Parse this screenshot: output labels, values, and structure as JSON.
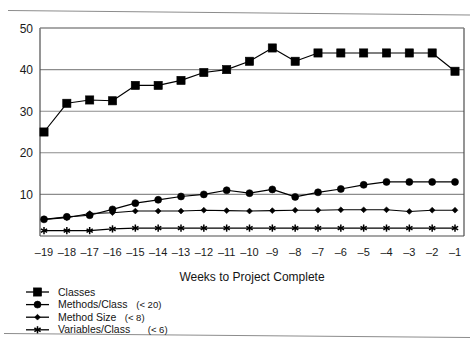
{
  "chart_data": {
    "type": "line",
    "title": "",
    "xlabel": "Weeks to Project Complete",
    "ylabel": "",
    "x": [
      -19,
      -18,
      -17,
      -16,
      -15,
      -14,
      -13,
      -12,
      -11,
      -10,
      -9,
      -8,
      -7,
      -6,
      -5,
      -4,
      -3,
      -2,
      -1
    ],
    "xlim": [
      -19.8,
      -0.4
    ],
    "ylim": [
      0,
      50
    ],
    "yticks": [
      10,
      20,
      30,
      40,
      50
    ],
    "xticks": [
      "-19",
      "-18",
      "-17",
      "-16",
      "-15",
      "-14",
      "-13",
      "-12",
      "-11",
      "-10",
      "-9",
      "-8",
      "-7",
      "-6",
      "-5",
      "-4",
      "-3",
      "-2",
      "-1"
    ],
    "grid": true,
    "grid_axis": "y",
    "legend_position": "below-left",
    "series": [
      {
        "name": "Classes",
        "marker": "square",
        "values": [
          25.0,
          31.9,
          32.7,
          32.5,
          36.2,
          36.2,
          37.4,
          39.3,
          40.0,
          42.0,
          45.2,
          42.0,
          44.0,
          44.0,
          44.0,
          44.0,
          44.0,
          44.0,
          39.6
        ]
      },
      {
        "name": "Methods/Class (< 20)",
        "marker": "circle",
        "values": [
          4.0,
          4.6,
          5.0,
          6.4,
          7.9,
          8.7,
          9.5,
          10.0,
          11.0,
          10.3,
          11.2,
          9.4,
          10.5,
          11.3,
          12.3,
          13.0,
          13.0,
          13.0,
          13.0
        ]
      },
      {
        "name": "Method Size (< 8)",
        "marker": "diamond",
        "values": [
          4.0,
          4.4,
          5.4,
          5.6,
          6.0,
          6.0,
          6.0,
          6.2,
          6.1,
          6.0,
          6.1,
          6.2,
          6.2,
          6.3,
          6.3,
          6.3,
          5.9,
          6.2,
          6.2
        ]
      },
      {
        "name": "Variables/Class (< 6)",
        "marker": "asterisk",
        "values": [
          1.3,
          1.3,
          1.3,
          1.7,
          1.9,
          1.9,
          1.9,
          1.9,
          1.9,
          1.9,
          1.9,
          1.9,
          1.9,
          1.9,
          1.9,
          1.9,
          1.9,
          1.9,
          1.9
        ]
      }
    ]
  },
  "legend": {
    "items": [
      {
        "label": "Classes",
        "qualifier": ""
      },
      {
        "label": "Methods/Class",
        "qualifier": "(< 20)"
      },
      {
        "label": "Method Size",
        "qualifier": "(< 8)"
      },
      {
        "label": "Variables/Class",
        "qualifier": "(< 6)"
      }
    ]
  },
  "colors": {
    "line": "#000000",
    "marker": "#000000",
    "grid": "#8c8c8c",
    "axis": "#4d4d4d",
    "text": "#141414",
    "background": "#ffffff"
  }
}
